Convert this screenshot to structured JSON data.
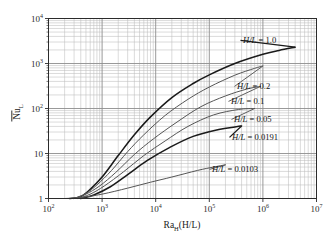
{
  "figure": {
    "background": "#ffffff",
    "plot_border_color": "#2b2b2b",
    "major_grid_color": "#8d8d8d",
    "minor_grid_color": "#bdbdbd",
    "curve_color": "#1a1a1a",
    "curve_color_light": "#555555"
  },
  "axes": {
    "x": {
      "label_parts": {
        "base": "Ra",
        "sub": "H",
        "tail": "(H/L)"
      },
      "label_text": "Ra_H(H/L)",
      "scale": "log",
      "min": 100,
      "max": 10000000,
      "tick_values": [
        100,
        1000,
        10000,
        100000,
        1000000,
        10000000
      ],
      "tick_labels": [
        "10",
        "10",
        "10",
        "10",
        "10",
        "10"
      ],
      "tick_exponents": [
        "2",
        "3",
        "4",
        "5",
        "6",
        "7"
      ],
      "minor_ticks": true
    },
    "y": {
      "label_parts": {
        "base": "Nu",
        "sub": "L",
        "overbar": true
      },
      "label_text": "Nu_L",
      "scale": "log",
      "min": 1,
      "max": 10000,
      "tick_values": [
        1,
        10,
        100,
        1000,
        10000
      ],
      "tick_labels": [
        "1",
        "10",
        "10",
        "10",
        "10"
      ],
      "tick_exponents": [
        "",
        "",
        "2",
        "3",
        "4"
      ],
      "minor_ticks": true
    }
  },
  "chart_data": {
    "type": "line",
    "title": "",
    "subtitle": "",
    "xlabel": "Ra_H(H/L)",
    "ylabel": "Nu_L",
    "xscale": "log",
    "yscale": "log",
    "xlim": [
      100,
      10000000
    ],
    "ylim": [
      1,
      10000
    ],
    "grid": true,
    "grid_style": "log-log major and minor gridlines",
    "legend": "inline curve labels at right ends",
    "series": [
      {
        "name": "H/L = 1.0",
        "label": "H/L = 1.0",
        "ratio": 1.0,
        "x": [
          250,
          400,
          600,
          1000,
          2000,
          4000,
          8000,
          20000,
          50000,
          100000,
          300000,
          1000000,
          2000000,
          4000000
        ],
        "y": [
          1.0,
          1.1,
          1.6,
          3.0,
          9.0,
          26,
          65,
          175,
          360,
          560,
          1000,
          1600,
          1950,
          2300
        ]
      },
      {
        "name": "H/L = 0.2",
        "label": "H/L = 0.2",
        "ratio": 0.2,
        "x": [
          300,
          500,
          800,
          1500,
          3000,
          6000,
          15000,
          40000,
          100000,
          300000,
          700000,
          1000000
        ],
        "y": [
          1.0,
          1.3,
          2.0,
          4.2,
          11,
          26,
          70,
          160,
          300,
          550,
          780,
          880
        ]
      },
      {
        "name": "H/L = 0.1",
        "label": "H/L = 0.1",
        "ratio": 0.1,
        "x": [
          300,
          500,
          900,
          1800,
          4000,
          9000,
          25000,
          70000,
          200000,
          500000,
          900000
        ],
        "y": [
          1.0,
          1.25,
          1.9,
          3.8,
          9.5,
          21,
          50,
          110,
          190,
          270,
          310
        ]
      },
      {
        "name": "H/L = 0.05",
        "label": "H/L = 0.05",
        "ratio": 0.05,
        "x": [
          350,
          600,
          1100,
          2500,
          6000,
          15000,
          40000,
          120000,
          350000,
          700000
        ],
        "y": [
          1.0,
          1.25,
          1.9,
          3.9,
          9.0,
          19,
          40,
          72,
          95,
          100
        ]
      },
      {
        "name": "H/L = 0.0191",
        "label": "H/L = 0.0191",
        "ratio": 0.0191,
        "x": [
          400,
          700,
          1400,
          3000,
          7000,
          18000,
          50000,
          150000,
          300000,
          400000
        ],
        "y": [
          1.0,
          1.2,
          1.8,
          3.4,
          7.0,
          13.5,
          24,
          34,
          39,
          41
        ]
      },
      {
        "name": "H/L = 0.0103",
        "label": "H/L = 0.0103",
        "ratio": 0.0103,
        "x": [
          200,
          400,
          1000,
          3000,
          8000,
          20000,
          60000,
          120000,
          200000
        ],
        "y": [
          1.0,
          1.05,
          1.25,
          1.7,
          2.3,
          3.0,
          4.2,
          5.0,
          5.6
        ]
      }
    ]
  },
  "curve_labels": [
    {
      "id": "hl-1-0",
      "text": "H/L = 1.0",
      "variable": "H/L",
      "value": "1.0"
    },
    {
      "id": "hl-0-2",
      "text": "H/L = 0.2",
      "variable": "H/L",
      "value": "0.2"
    },
    {
      "id": "hl-0-1",
      "text": "H/L = 0.1",
      "variable": "H/L",
      "value": "0.1"
    },
    {
      "id": "hl-0-05",
      "text": "H/L = 0.05",
      "variable": "H/L",
      "value": "0.05"
    },
    {
      "id": "hl-0-0191",
      "text": "H/L = 0.0191",
      "variable": "H/L",
      "value": "0.0191"
    },
    {
      "id": "hl-0-0103",
      "text": "H/L = 0.0103",
      "variable": "H/L",
      "value": "0.0103"
    }
  ]
}
